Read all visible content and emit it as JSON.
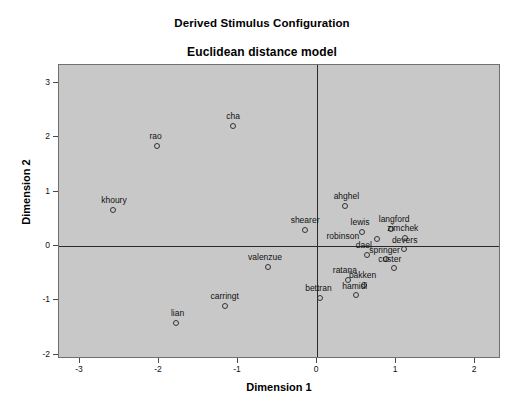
{
  "titles": {
    "main": "Derived Stimulus Configuration",
    "sub": "Euclidean distance model"
  },
  "axis_titles": {
    "x": "Dimension 1",
    "y": "Dimension 2"
  },
  "colors": {
    "plot_background": "#c8c8c8",
    "page_background": "#ffffff",
    "axis_line": "#2a2a2a",
    "frame_border": "#707070",
    "marker_stroke": "#333333",
    "text": "#111111"
  },
  "chart_data": {
    "type": "scatter",
    "title": "Derived Stimulus Configuration",
    "subtitle": "Euclidean distance model",
    "xlabel": "Dimension 1",
    "ylabel": "Dimension 2",
    "xlim": [
      -3.27,
      2.33
    ],
    "ylim": [
      -2.08,
      3.33
    ],
    "xticks": [
      -3,
      -2,
      -1,
      0,
      1,
      2
    ],
    "yticks": [
      -2,
      -1,
      0,
      1,
      2,
      3
    ],
    "xticklabels": [
      "-3",
      "-2",
      "-1",
      "0",
      "1",
      "2"
    ],
    "yticklabels": [
      "-2",
      "-1",
      "0",
      "1",
      "2",
      "3"
    ],
    "grid": false,
    "legend": null,
    "zero_lines": {
      "x": 0,
      "y": 0
    },
    "marker": "open-circle",
    "points": [
      {
        "label": "cha",
        "x": -1.06,
        "y": 2.21,
        "label_dx": 0,
        "label_dy": -11
      },
      {
        "label": "rao",
        "x": -2.02,
        "y": 1.84,
        "label_dx": -2,
        "label_dy": -11
      },
      {
        "label": "khoury",
        "x": -2.58,
        "y": 0.66,
        "label_dx": 1,
        "label_dy": -11
      },
      {
        "label": "ahghel",
        "x": 0.35,
        "y": 0.73,
        "label_dx": 2,
        "label_dy": -11
      },
      {
        "label": "shearer",
        "x": -0.15,
        "y": 0.3,
        "label_dx": 0,
        "label_dy": -11
      },
      {
        "label": "lewis",
        "x": 0.57,
        "y": 0.26,
        "label_dx": -2,
        "label_dy": -11
      },
      {
        "label": "langford",
        "x": 0.94,
        "y": 0.32,
        "label_dx": 3,
        "label_dy": -11
      },
      {
        "label": "robinson",
        "x": 0.76,
        "y": 0.12,
        "label_dx": -34,
        "label_dy": -4
      },
      {
        "label": "zimchek",
        "x": 1.11,
        "y": 0.14,
        "label_dx": -2,
        "label_dy": -11
      },
      {
        "label": "valenzue",
        "x": -0.62,
        "y": -0.38,
        "label_dx": -3,
        "label_dy": -11
      },
      {
        "label": "dael",
        "x": 0.63,
        "y": -0.16,
        "label_dx": -3,
        "label_dy": -11
      },
      {
        "label": "springer",
        "x": 0.87,
        "y": -0.24,
        "label_dx": -1,
        "label_dy": -10
      },
      {
        "label": "devers",
        "x": 1.1,
        "y": -0.05,
        "label_dx": 1,
        "label_dy": -10
      },
      {
        "label": "custer",
        "x": 0.97,
        "y": -0.4,
        "label_dx": -4,
        "label_dy": -10
      },
      {
        "label": "ratana",
        "x": 0.39,
        "y": -0.62,
        "label_dx": -3,
        "label_dy": -11
      },
      {
        "label": "bakken",
        "x": 0.6,
        "y": -0.72,
        "label_dx": -2,
        "label_dy": -11
      },
      {
        "label": "bettran",
        "x": 0.04,
        "y": -0.96,
        "label_dx": -2,
        "label_dy": -11
      },
      {
        "label": "hamidi",
        "x": 0.49,
        "y": -0.91,
        "label_dx": -1,
        "label_dy": -10
      },
      {
        "label": "carringt",
        "x": -1.17,
        "y": -1.1,
        "label_dx": 0,
        "label_dy": -11
      },
      {
        "label": "lian",
        "x": -1.78,
        "y": -1.41,
        "label_dx": 1,
        "label_dy": -11
      }
    ]
  },
  "plot_geometry": {
    "frame_left": 58,
    "frame_top": 64,
    "frame_width": 442,
    "frame_height": 294,
    "x_origin_px": 316,
    "y_origin_px": 245,
    "px_per_x_unit": 79,
    "px_per_y_unit": 54.3
  }
}
